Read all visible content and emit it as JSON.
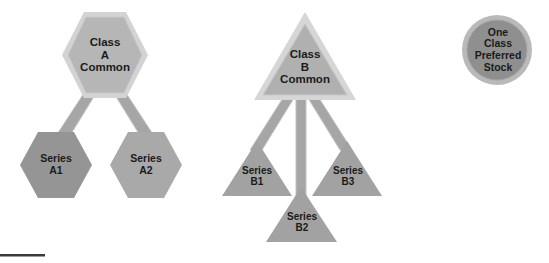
{
  "diagram": {
    "background_color": "#ffffff",
    "palette": {
      "class_a_fill": "#b6b6b6",
      "class_a_border": "#d3d3d3",
      "class_b_fill": "#b0b0b0",
      "class_b_border": "#d6d6d6",
      "series_a1_fill": "#959595",
      "series_a2_fill": "#a9a9a9",
      "series_b_fill": "#a2a2a2",
      "preferred_fill": "#8f8f8f",
      "preferred_ring": "#b9b9b9",
      "connector_fill": "#a6a6a6",
      "connector_edge": "#bdbdbd",
      "rule_color": "#3a3a3a",
      "text_color": "#1b1b1b"
    },
    "nodes": [
      {
        "id": "class-a-common",
        "shape": "hexagon",
        "lines": [
          "Class",
          "A",
          "Common"
        ],
        "fill": "#b6b6b6",
        "border": "#d3d3d3"
      },
      {
        "id": "series-a1",
        "shape": "hexagon",
        "lines": [
          "Series",
          "A1"
        ],
        "fill": "#959595",
        "border": "none"
      },
      {
        "id": "series-a2",
        "shape": "hexagon",
        "lines": [
          "Series",
          "A2"
        ],
        "fill": "#a9a9a9",
        "border": "none"
      },
      {
        "id": "class-b-common",
        "shape": "triangle",
        "lines": [
          "Class",
          "B",
          "Common"
        ],
        "fill": "#b0b0b0",
        "border": "#d6d6d6"
      },
      {
        "id": "series-b1",
        "shape": "triangle",
        "lines": [
          "Series",
          "B1"
        ],
        "fill": "#a2a2a2",
        "border": "none"
      },
      {
        "id": "series-b2",
        "shape": "triangle",
        "lines": [
          "Series",
          "B2"
        ],
        "fill": "#a2a2a2",
        "border": "none"
      },
      {
        "id": "series-b3",
        "shape": "triangle",
        "lines": [
          "Series",
          "B3"
        ],
        "fill": "#a2a2a2",
        "border": "none"
      },
      {
        "id": "preferred-stock",
        "shape": "circle",
        "lines": [
          "One",
          "Class",
          "Preferred",
          "Stock"
        ],
        "fill": "#8f8f8f",
        "border": "#b9b9b9"
      }
    ],
    "edges": [
      {
        "from": "class-a-common",
        "to": "series-a1"
      },
      {
        "from": "class-a-common",
        "to": "series-a2"
      },
      {
        "from": "class-b-common",
        "to": "series-b1"
      },
      {
        "from": "class-b-common",
        "to": "series-b2"
      },
      {
        "from": "class-b-common",
        "to": "series-b3"
      }
    ],
    "labels": {
      "class_a": {
        "line1": "Class",
        "line2": "A",
        "line3": "Common"
      },
      "series_a1": {
        "line1": "Series",
        "line2": "A1"
      },
      "series_a2": {
        "line1": "Series",
        "line2": "A2"
      },
      "class_b": {
        "line1": "Class",
        "line2": "B",
        "line3": "Common"
      },
      "series_b1": {
        "line1": "Series",
        "line2": "B1"
      },
      "series_b2": {
        "line1": "Series",
        "line2": "B2"
      },
      "series_b3": {
        "line1": "Series",
        "line2": "B3"
      },
      "preferred": {
        "line1": "One",
        "line2": "Class",
        "line3": "Preferred",
        "line4": "Stock"
      }
    },
    "footer_rule": {
      "present": true,
      "color": "#3a3a3a"
    }
  }
}
